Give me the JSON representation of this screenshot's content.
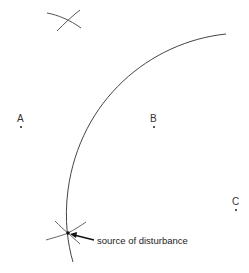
{
  "points": [
    {
      "label": "A",
      "x": 21,
      "y": 127
    },
    {
      "label": "B",
      "x": 154,
      "y": 127
    },
    {
      "label": "C",
      "x": 235,
      "y": 209
    }
  ],
  "annotation": {
    "text": "source of disturbance"
  },
  "colors": {
    "line": "#444444",
    "text": "#222222",
    "background": "#ffffff"
  }
}
